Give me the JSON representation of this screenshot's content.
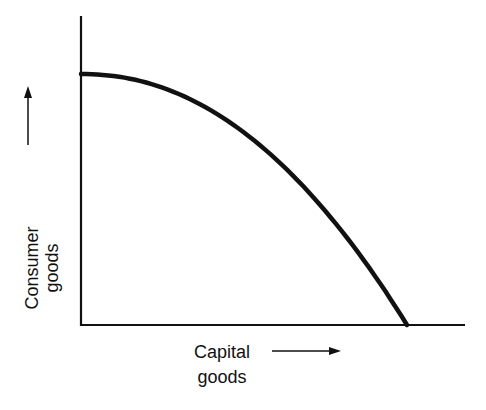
{
  "chart_data": {
    "type": "line",
    "title": "",
    "xlabel": [
      "Capital",
      "goods"
    ],
    "ylabel": [
      "Consumer",
      "goods"
    ],
    "x_arrow": "right",
    "y_arrow": "up",
    "series": [
      {
        "name": "production-possibility-curve",
        "x": [
          0,
          0.2,
          0.4,
          0.6,
          0.8,
          0.9,
          1.0
        ],
        "y": [
          1.0,
          0.96,
          0.84,
          0.64,
          0.36,
          0.19,
          0.0
        ]
      }
    ],
    "xlim": [
      0,
      1.18
    ],
    "ylim": [
      0,
      1.24
    ],
    "grid": false,
    "ticks": false
  },
  "colors": {
    "line": "#111111",
    "background": "#ffffff"
  }
}
